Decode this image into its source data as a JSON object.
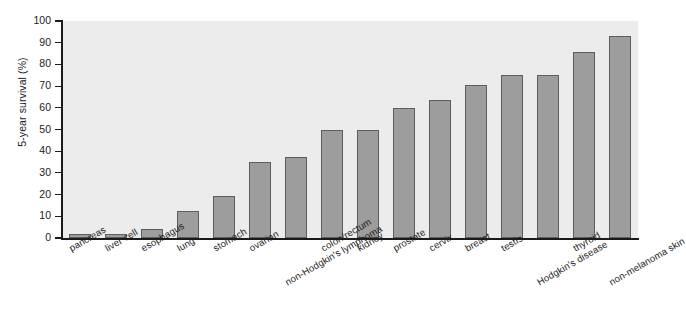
{
  "chart_data": {
    "type": "bar",
    "title": "",
    "xlabel": "",
    "ylabel": "5-year survival (%)",
    "ylim": [
      0,
      100
    ],
    "yticks": [
      0,
      10,
      20,
      30,
      40,
      50,
      60,
      70,
      80,
      90,
      100
    ],
    "ytick_labels": [
      "0",
      "10",
      "20",
      "30",
      "40",
      "50",
      "60",
      "70",
      "80",
      "90",
      "100"
    ],
    "grid": false,
    "legend": "none",
    "bar_color": "#9d9d9d",
    "bar_edge_color": "#5d5d5d",
    "plot_background": "#ececec",
    "categories": [
      "pancreas",
      "liver cell",
      "esophagus",
      "lung",
      "stomach",
      "ovarian",
      "non-Hodgkin's lymphoma",
      "colon/rectum",
      "kidney",
      "prostate",
      "cervix",
      "breast",
      "testis",
      "Hodgkin's disease",
      "thyroid",
      "non-melanoma skin"
    ],
    "values": [
      2,
      2,
      4,
      12.5,
      19.5,
      35,
      37.5,
      50,
      50,
      60,
      63.5,
      70.5,
      75,
      75,
      85.5,
      93
    ]
  }
}
